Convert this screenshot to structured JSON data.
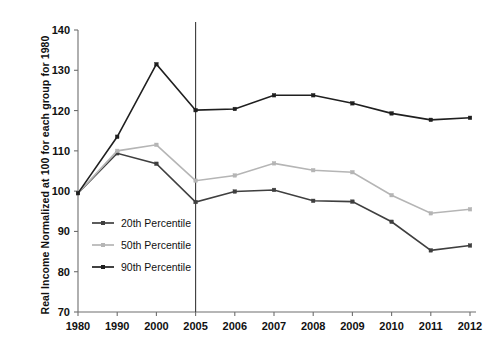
{
  "chart_data": {
    "type": "line",
    "title": "",
    "subtitle": "",
    "xlabel": "",
    "ylabel": "Real Income Normalized at 100 for each group for 1980",
    "categories": [
      "1980",
      "1990",
      "2000",
      "2005",
      "2006",
      "2007",
      "2008",
      "2009",
      "2010",
      "2011",
      "2012"
    ],
    "xticklabels": [
      "1980",
      "1990",
      "2000",
      "2005",
      "2006",
      "2007",
      "2008",
      "2009",
      "2010",
      "2011",
      "2012"
    ],
    "yticklabels": [
      "70",
      "80",
      "90",
      "100",
      "110",
      "120",
      "130",
      "140"
    ],
    "yticks": [
      70,
      80,
      90,
      100,
      110,
      120,
      130,
      140
    ],
    "ylim": [
      70,
      140
    ],
    "grid": false,
    "legend_position": "inside-lower-left",
    "series": [
      {
        "name": "20th Percentile",
        "color": "#3f3f3f",
        "values": [
          99.5,
          109.4,
          106.8,
          97.3,
          99.9,
          100.3,
          97.6,
          97.4,
          92.4,
          85.3,
          86.5
        ]
      },
      {
        "name": "50th Percentile",
        "color": "#b5b5b5",
        "values": [
          99.5,
          110.0,
          111.5,
          102.6,
          103.9,
          106.9,
          105.2,
          104.7,
          99.0,
          94.5,
          95.5
        ]
      },
      {
        "name": "90th Percentile",
        "color": "#1f1f1f",
        "values": [
          99.5,
          113.5,
          131.5,
          120.1,
          120.4,
          123.8,
          123.8,
          121.8,
          119.3,
          117.7,
          118.2
        ]
      }
    ],
    "annotations": [
      {
        "type": "vertical-line",
        "at_category": "2005",
        "color": "#3a3a3a"
      }
    ]
  },
  "legend": {
    "items": [
      {
        "label": "20th Percentile",
        "color": "#3f3f3f"
      },
      {
        "label": "50th Percentile",
        "color": "#b5b5b5"
      },
      {
        "label": "90th Percentile",
        "color": "#1f1f1f"
      }
    ]
  }
}
